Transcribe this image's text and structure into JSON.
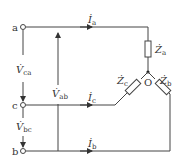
{
  "diagram": {
    "type": "three-phase Y-connected load circuit",
    "colors": {
      "line": "#444444",
      "text": "#333333",
      "background": "#ffffff"
    },
    "nodes": {
      "a": "a",
      "c": "c",
      "b": "b",
      "neutral": "O"
    },
    "currents": {
      "ia": {
        "main": "İ",
        "sub": "a"
      },
      "ic": {
        "main": "İ",
        "sub": "c"
      },
      "ib": {
        "main": "İ",
        "sub": "b"
      }
    },
    "voltages": {
      "vca": {
        "main": "V̇",
        "sub": "ca"
      },
      "vbc": {
        "main": "V̇",
        "sub": "bc"
      },
      "vab": {
        "main": "V̇",
        "sub": "ab"
      }
    },
    "impedances": {
      "za": {
        "main": "Ż",
        "sub": "a"
      },
      "zb": {
        "main": "Ż",
        "sub": "b"
      },
      "zc": {
        "main": "Ż",
        "sub": "c"
      }
    }
  }
}
